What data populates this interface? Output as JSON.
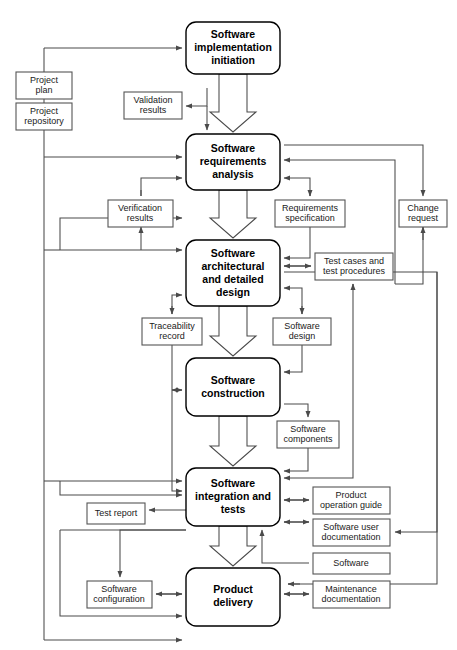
{
  "diagram": {
    "type": "flowchart",
    "colors": {
      "background": "#ffffff",
      "process_stroke": "#000000",
      "artifact_stroke": "#555555",
      "connector": "#4a4a4a",
      "text": "#000000"
    },
    "processes": [
      {
        "id": "impl-initiation",
        "lines": [
          "Software",
          "implementation",
          "initiation"
        ],
        "x": 186,
        "y": 22,
        "w": 94,
        "h": 52
      },
      {
        "id": "requirements-analysis",
        "lines": [
          "Software",
          "requirements",
          "analysis"
        ],
        "x": 186,
        "y": 134,
        "w": 94,
        "h": 56
      },
      {
        "id": "architectural-design",
        "lines": [
          "Software",
          "architectural",
          "and detailed",
          "design"
        ],
        "x": 186,
        "y": 240,
        "w": 94,
        "h": 66
      },
      {
        "id": "construction",
        "lines": [
          "Software",
          "construction"
        ],
        "x": 186,
        "y": 358,
        "w": 94,
        "h": 58
      },
      {
        "id": "integration-tests",
        "lines": [
          "Software",
          "integration and",
          "tests"
        ],
        "x": 186,
        "y": 468,
        "w": 94,
        "h": 58
      },
      {
        "id": "product-delivery",
        "lines": [
          "Product",
          "delivery"
        ],
        "x": 186,
        "y": 568,
        "w": 94,
        "h": 58
      }
    ],
    "artifacts": [
      {
        "id": "project-plan",
        "lines": [
          "Project",
          "plan"
        ],
        "x": 16,
        "y": 72,
        "w": 56,
        "h": 27
      },
      {
        "id": "project-repository",
        "lines": [
          "Project",
          "repository"
        ],
        "x": 16,
        "y": 103,
        "w": 56,
        "h": 27
      },
      {
        "id": "validation-results",
        "lines": [
          "Validation",
          "results"
        ],
        "x": 124,
        "y": 92,
        "w": 58,
        "h": 27
      },
      {
        "id": "verification-results",
        "lines": [
          "Verification",
          "results"
        ],
        "x": 108,
        "y": 200,
        "w": 65,
        "h": 27
      },
      {
        "id": "requirements-specification",
        "lines": [
          "Requirements",
          "specification"
        ],
        "x": 275,
        "y": 200,
        "w": 70,
        "h": 27
      },
      {
        "id": "change-request",
        "lines": [
          "Change",
          "request"
        ],
        "x": 399,
        "y": 200,
        "w": 48,
        "h": 27
      },
      {
        "id": "test-cases-procedures",
        "lines": [
          "Test cases and",
          "test procedures"
        ],
        "x": 315,
        "y": 253,
        "w": 78,
        "h": 27
      },
      {
        "id": "traceability-record",
        "lines": [
          "Traceability",
          "record"
        ],
        "x": 142,
        "y": 318,
        "w": 60,
        "h": 27
      },
      {
        "id": "software-design",
        "lines": [
          "Software",
          "design"
        ],
        "x": 273,
        "y": 318,
        "w": 58,
        "h": 27
      },
      {
        "id": "software-components",
        "lines": [
          "Software",
          "components"
        ],
        "x": 277,
        "y": 421,
        "w": 62,
        "h": 27
      },
      {
        "id": "product-operation-guide",
        "lines": [
          "Product",
          "operation guide"
        ],
        "x": 313,
        "y": 487,
        "w": 77,
        "h": 27
      },
      {
        "id": "test-report",
        "lines": [
          "Test report"
        ],
        "x": 87,
        "y": 503,
        "w": 58,
        "h": 21
      },
      {
        "id": "software-user-documentation",
        "lines": [
          "Software user",
          "documentation"
        ],
        "x": 313,
        "y": 519,
        "w": 77,
        "h": 27
      },
      {
        "id": "software",
        "lines": [
          "Software"
        ],
        "x": 313,
        "y": 553,
        "w": 77,
        "h": 21
      },
      {
        "id": "maintenance-documentation",
        "lines": [
          "Maintenance",
          "documentation"
        ],
        "x": 313,
        "y": 581,
        "w": 77,
        "h": 27
      },
      {
        "id": "software-configuration",
        "lines": [
          "Software",
          "configuration"
        ],
        "x": 87,
        "y": 581,
        "w": 65,
        "h": 27
      }
    ]
  }
}
